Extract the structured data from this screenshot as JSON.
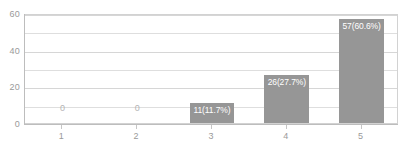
{
  "chart_data": {
    "type": "bar",
    "title": "",
    "subtitle": "",
    "xlabel": "",
    "ylabel": "",
    "categories": [
      "1",
      "2",
      "3",
      "4",
      "5"
    ],
    "values": [
      0,
      0,
      11,
      26,
      57
    ],
    "data_labels": [
      "0",
      "0",
      "11(11.7%)",
      "26(27.7%)",
      "57(60.6%)"
    ],
    "percentages": [
      0,
      0,
      11.7,
      27.7,
      60.6
    ],
    "total": 94,
    "ylim": [
      0,
      60
    ],
    "y_ticks": [
      "0",
      "20",
      "40",
      "60"
    ],
    "y_tick_values": [
      0,
      20,
      40,
      60
    ],
    "y_minor_gridlines": [
      10,
      30,
      50
    ],
    "grid": true,
    "legend": "none",
    "colors": {
      "bar": "#969696",
      "grid": "#dedede",
      "axis": "#bdbdbd",
      "frame": "#d2d2d2",
      "tick_text": "#9a9a9a",
      "label_inside": "#ffffff",
      "label_outside": "#b4b4b4",
      "background": "#ffffff"
    }
  }
}
